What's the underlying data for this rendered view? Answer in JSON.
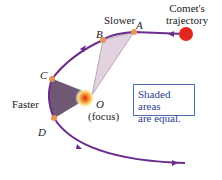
{
  "labels": {
    "comet": "Comet's\ntrajectory",
    "slower": "Slower",
    "faster": "Faster",
    "point_a": "A",
    "point_b": "B",
    "point_c": "C",
    "point_d": "D",
    "point_o": "O",
    "focus": "(focus)"
  },
  "note": {
    "line1": "Shaded areas",
    "line2": "are equal."
  },
  "colors": {
    "orbit": "#6b2d8c",
    "sweep_light": "#e3d2e0",
    "sweep_dark": "#6e5873",
    "point": "#e8955a",
    "comet": "#e0261f",
    "box_border": "#4a6fb5"
  }
}
